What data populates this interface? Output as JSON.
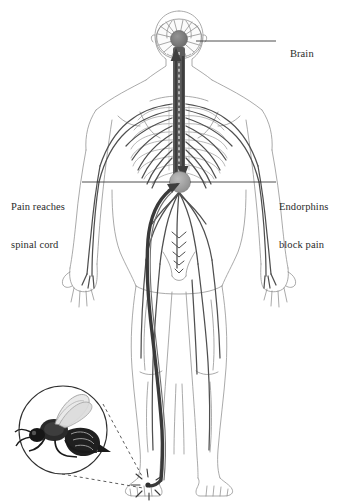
{
  "figure": {
    "type": "anatomical-diagram",
    "background_color": "#ffffff",
    "ink_color": "#2b2b2b",
    "outline_color": "#7a7a7a",
    "nerve_color": "#4a4a4a",
    "spine_color": "#5a5a5a",
    "node_color": "#9a9a9a"
  },
  "labels": {
    "brain": "Brain",
    "pain_line1": "Pain reaches",
    "pain_line2": "spinal cord",
    "endorphins_line1": "Endorphins",
    "endorphins_line2": "block pain"
  },
  "elements": {
    "brain_node": "brain-node",
    "spinal_node": "spinal-cord-node",
    "ascending_arrow": "pain-signal-up-arrow",
    "descending_arrow": "endorphin-signal-down-arrow",
    "sting_burst": "bee-sting-point",
    "bee_inset": "bee-magnifier-inset",
    "leader_lines": [
      "brain-leader-line",
      "pain-leader-line",
      "endorphins-leader-line"
    ],
    "callout_lines": [
      "bee-callout-line-upper",
      "bee-callout-line-lower"
    ]
  }
}
